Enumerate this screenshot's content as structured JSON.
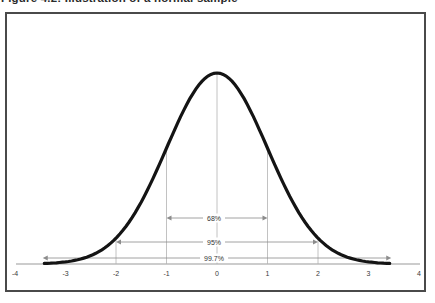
{
  "caption": "Figure 4.2: Illustration of a normal sample",
  "chart_data": {
    "type": "line",
    "subtype": "normal-distribution-bell-curve",
    "title": "",
    "xlabel": "",
    "ylabel": "",
    "mean": 0,
    "sd": 1,
    "xlim": [
      -4,
      4
    ],
    "x_ticks": [
      -4,
      -3,
      -2,
      -1,
      0,
      1,
      2,
      3,
      4
    ],
    "grid": false,
    "legend": false,
    "guide_lines_sigma": [
      -2,
      -1,
      0,
      1,
      2
    ],
    "annotations": [
      {
        "label": "68%",
        "from_sigma": -1,
        "to_sigma": 1
      },
      {
        "label": "95%",
        "from_sigma": -2,
        "to_sigma": 2
      },
      {
        "label": "99.7%",
        "from_sigma": -3,
        "to_sigma": 3
      }
    ],
    "colors": {
      "curve": "#141414",
      "guides": "#b3b3b3",
      "arrows": "#8c8c8c",
      "axis": "#999999",
      "text": "#3a3a3a",
      "frame": "#4a4a4a",
      "background": "#ffffff"
    }
  }
}
